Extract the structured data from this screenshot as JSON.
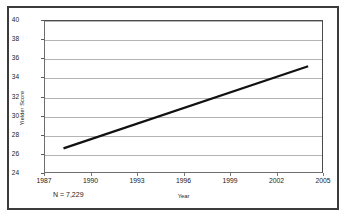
{
  "chart_data": {
    "type": "line",
    "title": "",
    "xlabel": "Year",
    "ylabel": "Yielder Score",
    "xlim": [
      1987,
      2005
    ],
    "ylim": [
      24,
      40
    ],
    "grid": true,
    "legend": null,
    "xticks": [
      1987,
      1990,
      1993,
      1996,
      1999,
      2002,
      2005
    ],
    "xtick_labels": [
      "1987",
      "1990",
      "1993",
      "1996",
      "1999",
      "2002",
      "2005"
    ],
    "yticks": [
      24,
      26,
      28,
      30,
      32,
      34,
      36,
      38,
      40
    ],
    "ytick_labels": [
      "24",
      "26",
      "28",
      "30",
      "32",
      "34",
      "36",
      "38",
      "40"
    ],
    "series": [
      {
        "name": "Yielder Score trend",
        "color": "#111111",
        "linewidth": 2.2,
        "x": [
          1988.2,
          2004.1
        ],
        "y": [
          26.5,
          35.2
        ]
      }
    ],
    "annotations": [
      {
        "text": "N = 7,229",
        "x": 1987.4,
        "y": 23.1
      }
    ]
  },
  "figure": {
    "border_color": "#3b3b3b",
    "background": "#ffffff",
    "gridline_color": "#b4b4b4",
    "axis_color": "#4a4a4a"
  }
}
